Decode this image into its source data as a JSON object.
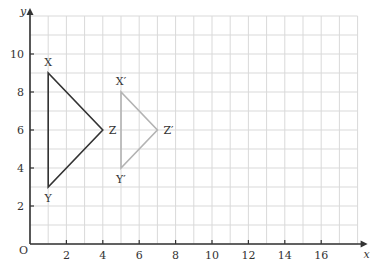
{
  "diagram": {
    "type": "coordinate-grid-transformation",
    "axes": {
      "x_label": "x",
      "y_label": "y",
      "origin_label": "O",
      "x_ticks": [
        "2",
        "4",
        "6",
        "8",
        "10",
        "12",
        "14",
        "16"
      ],
      "y_ticks": [
        "2",
        "4",
        "6",
        "8",
        "10"
      ],
      "x_range": [
        0,
        18
      ],
      "y_range": [
        0,
        12
      ]
    },
    "colors": {
      "grid": "#d9d9d9",
      "axis": "#333333",
      "original": "#333333",
      "image": "#b3b3b3"
    },
    "triangles": [
      {
        "name": "original",
        "vertices": [
          {
            "label": "X",
            "x": 1,
            "y": 9
          },
          {
            "label": "Y",
            "x": 1,
            "y": 3
          },
          {
            "label": "Z",
            "x": 4,
            "y": 6
          }
        ]
      },
      {
        "name": "image",
        "vertices": [
          {
            "label": "X′",
            "x": 5,
            "y": 8
          },
          {
            "label": "Y′",
            "x": 5,
            "y": 4
          },
          {
            "label": "Z′",
            "x": 7,
            "y": 6
          }
        ]
      }
    ]
  }
}
